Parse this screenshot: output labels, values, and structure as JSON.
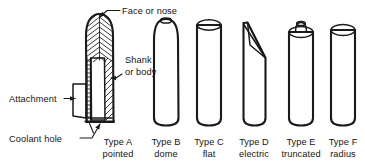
{
  "figure": {
    "background_color": "#ffffff",
    "ink_color": "#1a1a1a"
  },
  "callouts": [
    {
      "id": "face-or-nose",
      "text": "Face or nose",
      "points_to": "tool-tip"
    },
    {
      "id": "shank-or-body",
      "line1": "Shank",
      "line2": "or body",
      "points_to": "tool-body-wall"
    },
    {
      "id": "attachment",
      "text": "Attachment",
      "points_to": "attachment-bracket"
    },
    {
      "id": "coolant-hole",
      "text": "Coolant hole",
      "points_to": "coolant-channel"
    }
  ],
  "types": [
    {
      "id": "type-a",
      "name": "Type A",
      "shape": "pointed",
      "cx": 118
    },
    {
      "id": "type-b",
      "name": "Type B",
      "shape": "dome",
      "cx": 166
    },
    {
      "id": "type-c",
      "name": "Type C",
      "shape": "flat",
      "cx": 209
    },
    {
      "id": "type-d",
      "name": "Type D",
      "shape": "electric",
      "cx": 254
    },
    {
      "id": "type-e",
      "name": "Type E",
      "shape": "truncated",
      "cx": 301
    },
    {
      "id": "type-f",
      "name": "Type F",
      "shape": "radius",
      "cx": 343
    }
  ]
}
